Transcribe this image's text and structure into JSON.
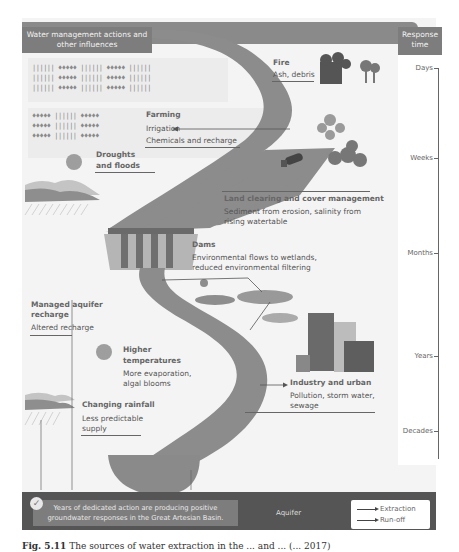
{
  "diagram": {
    "title": "Water management actions and other influences",
    "response_time": {
      "header": "Response time",
      "ticks": [
        "Days",
        "Weeks",
        "Months",
        "Years",
        "Decades"
      ]
    },
    "influences": [
      {
        "id": "fire",
        "heading": "Fire",
        "detail": "Ash, debris"
      },
      {
        "id": "farming",
        "heading": "Farming",
        "detail": "Irrigation",
        "detail2": "Chemicals and recharge"
      },
      {
        "id": "droughts",
        "heading": "Droughts and floods",
        "heading_l1": "Droughts",
        "heading_l2": "and floods"
      },
      {
        "id": "land",
        "heading": "Land clearing and cover management",
        "detail_l1": "Sediment from erosion, salinity from",
        "detail_l2": "rising watertable"
      },
      {
        "id": "dams",
        "heading": "Dams",
        "detail_l1": "Environmental flows to wetlands,",
        "detail_l2": "reduced environmental filtering"
      },
      {
        "id": "mar",
        "heading_l1": "Managed aquifer",
        "heading_l2": "recharge",
        "detail": "Altered recharge"
      },
      {
        "id": "temp",
        "heading_l1": "Higher",
        "heading_l2": "temperatures",
        "detail_l1": "More evaporation,",
        "detail_l2": "algal blooms"
      },
      {
        "id": "industry",
        "heading": "Industry and urban",
        "detail_l1": "Pollution, storm water,",
        "detail_l2": "sewage"
      },
      {
        "id": "rainfall",
        "heading": "Changing rainfall",
        "detail_l1": "Less predictable",
        "detail_l2": "supply"
      }
    ],
    "aquifer_label": "Aquifer",
    "note": {
      "line1": "Years of dedicated action are producing positive",
      "line2": "groundwater responses in the Great Artesian Basin."
    },
    "legend": [
      {
        "label": "Extraction"
      },
      {
        "label": "Run-off"
      }
    ],
    "colors": {
      "river": "#8c8c8c",
      "header": "#7d7d7d",
      "aquifer": "#555555",
      "ground": "#a4a4a4",
      "background": "#f4f4f4"
    }
  },
  "caption": {
    "prefix": "Fig. 5.11",
    "text": "The sources of water extraction in the ... and ... (... 2017)"
  },
  "crops": {
    "row_a": "|||||| ♦♦♦♦♦ |||||| ♦♦♦♦♦ ||||||",
    "row_b": "♦♦♦♦♦ |||||| ♦♦♦♦♦"
  }
}
